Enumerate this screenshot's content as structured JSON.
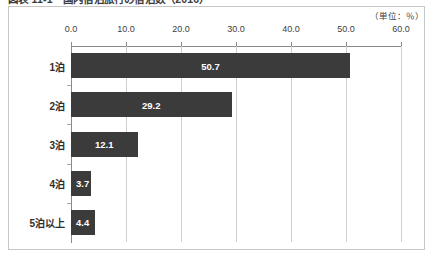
{
  "figure": {
    "caption": "図表 11-1　国内宿泊旅行の宿泊数（2016）",
    "unit_note": "（単位：％）"
  },
  "colors": {
    "bar": "#3b3b3b",
    "frame": "#c6c6c6",
    "gridline": "#cfcfcf",
    "axis": "#8a8a8a",
    "value_label": "#ffffff",
    "text": "#3c3c3c",
    "background": "#ffffff"
  },
  "chart_data": {
    "type": "bar",
    "orientation": "horizontal",
    "title": "図表 11-1　国内宿泊旅行の宿泊数（2016）",
    "xlabel": "",
    "ylabel": "",
    "unit": "％",
    "categories": [
      "1泊",
      "2泊",
      "3泊",
      "4泊",
      "5泊以上"
    ],
    "values": [
      50.7,
      29.2,
      12.1,
      3.7,
      4.4
    ],
    "value_labels": [
      "50.7",
      "29.2",
      "12.1",
      "3.7",
      "4.4"
    ],
    "xlim": [
      0.0,
      60.0
    ],
    "xticks": [
      0.0,
      10.0,
      20.0,
      30.0,
      40.0,
      50.0,
      60.0
    ],
    "xtick_labels": [
      "0.0",
      "10.0",
      "20.0",
      "30.0",
      "40.0",
      "50.0",
      "60.0"
    ],
    "axis_position": "top",
    "grid": true,
    "grid_axis": "x",
    "legend": false,
    "series": [
      {
        "name": "宿泊数構成比",
        "values": [
          50.7,
          29.2,
          12.1,
          3.7,
          4.4
        ]
      }
    ]
  }
}
